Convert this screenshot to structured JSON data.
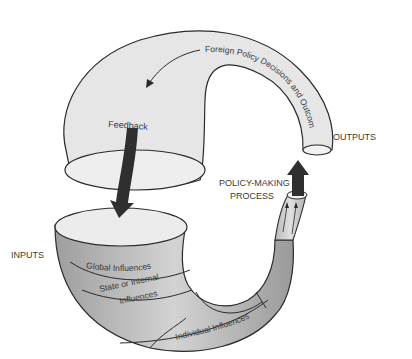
{
  "diagram": {
    "labels": {
      "outputs": "OUTPUTS",
      "inputs": "INPUTS",
      "policy_making_line1": "POLICY-MAKING",
      "policy_making_line2": "PROCESS",
      "feedback": "Feedback",
      "foreign_policy_decisions": "Foreign Policy Decisions and Outcomes",
      "global_influences": "Global Influences",
      "state_internal_line1": "State or Internal",
      "state_internal_line2": "Influences",
      "individual_influences": "Individual Influences"
    },
    "colors": {
      "outline": "#2b2b2b",
      "light_fill": "#e6e6e6",
      "mid_fill": "#c8c8c8",
      "dark_fill": "#a9a9a9",
      "arrow": "#2f2f2f",
      "text": "#3a3a3a"
    }
  }
}
